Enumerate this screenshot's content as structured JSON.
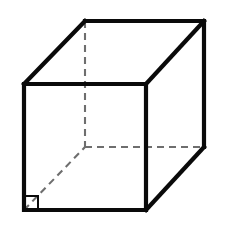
{
  "figure": {
    "shape_name": "cube",
    "projection": "oblique",
    "canvas": {
      "width": 226,
      "height": 230,
      "background": "#ffffff"
    },
    "colors": {
      "visible_edge": "#0a0a0a",
      "hidden_edge": "#6e6e6e",
      "face": "#ffffff",
      "marker": "#0a0a0a"
    },
    "stroke_widths": {
      "visible_edge": 4.2,
      "hidden_edge": 2.1,
      "angle_marker": 2.0
    },
    "dash_pattern": "7 5",
    "depth_offset": {
      "dx": 61,
      "dy": -63
    },
    "vertices": {
      "front_top_left": {
        "x": 24,
        "y": 84
      },
      "front_top_right": {
        "x": 146,
        "y": 84
      },
      "front_bottom_right": {
        "x": 146,
        "y": 210
      },
      "front_bottom_left": {
        "x": 24,
        "y": 210
      },
      "back_top_left": {
        "x": 85,
        "y": 21
      },
      "back_top_right": {
        "x": 204,
        "y": 21
      },
      "back_bottom_right": {
        "x": 204,
        "y": 147
      },
      "back_bottom_left": {
        "x": 85,
        "y": 147
      }
    },
    "visible_edges": [
      {
        "name": "front-top",
        "from": "front_top_left",
        "to": "front_top_right"
      },
      {
        "name": "front-right",
        "from": "front_top_right",
        "to": "front_bottom_right"
      },
      {
        "name": "front-bottom",
        "from": "front_bottom_right",
        "to": "front_bottom_left"
      },
      {
        "name": "front-left",
        "from": "front_bottom_left",
        "to": "front_top_left"
      },
      {
        "name": "back-top",
        "from": "back_top_left",
        "to": "back_top_right"
      },
      {
        "name": "back-right",
        "from": "back_top_right",
        "to": "back_bottom_right"
      },
      {
        "name": "depth-top-left",
        "from": "front_top_left",
        "to": "back_top_left"
      },
      {
        "name": "depth-top-right",
        "from": "front_top_right",
        "to": "back_top_right"
      },
      {
        "name": "depth-bottom-right",
        "from": "front_bottom_right",
        "to": "back_bottom_right"
      }
    ],
    "hidden_edges": [
      {
        "name": "back-left-vertical",
        "from": "back_top_left",
        "to": "back_bottom_left"
      },
      {
        "name": "back-bottom",
        "from": "back_bottom_left",
        "to": "back_bottom_right"
      },
      {
        "name": "depth-bottom-left",
        "from": "front_bottom_left",
        "to": "back_bottom_left"
      }
    ],
    "angle_marker": {
      "name": "right-angle-marker",
      "at_vertex": "front_bottom_left",
      "size": 14,
      "x": 24,
      "y": 196
    }
  }
}
